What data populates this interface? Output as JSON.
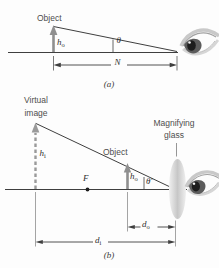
{
  "colors": {
    "line": "#3f3f3f",
    "gray_arrow": "#8f8f8f",
    "dashed_arrow": "#9a9a9a",
    "extension_line": "#9a9a9a",
    "lens_fill": "#c9c9c9",
    "text": "#4e4e4e"
  },
  "part_a": {
    "caption": "(a)",
    "object_label": "Object",
    "object_height_symbol": "h",
    "object_height_sub": "o",
    "angle_symbol": "θ",
    "near_point_distance_symbol": "N"
  },
  "part_b": {
    "caption": "(b)",
    "virtual_image_label_line1": "Virtual",
    "virtual_image_label_line2": "image",
    "object_label": "Object",
    "magnifying_glass_label_line1": "Magnifying",
    "magnifying_glass_label_line2": "glass",
    "image_height_symbol": "h",
    "image_height_sub": "i",
    "object_height_symbol": "h",
    "object_height_sub": "o",
    "angle_symbol": "θ′",
    "focal_point_symbol": "F",
    "object_distance_symbol": "d",
    "object_distance_sub": "o",
    "image_distance_symbol": "d",
    "image_distance_sub": "i"
  }
}
